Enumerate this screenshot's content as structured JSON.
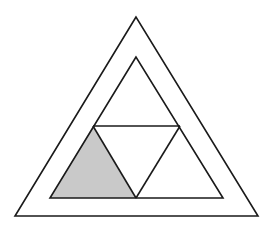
{
  "diagram": {
    "colors": {
      "stroke": "#1a1a1a",
      "shade": "#c9c9c9",
      "background": "#ffffff"
    },
    "outer_triangle": {
      "points": [
        [
          136,
          17
        ],
        [
          15,
          216
        ],
        [
          258,
          216
        ]
      ]
    },
    "inner_triangle": {
      "points": [
        [
          136,
          57
        ],
        [
          50,
          198
        ],
        [
          223,
          198
        ]
      ]
    },
    "midline": {
      "from": [
        93,
        126
      ],
      "to": [
        180,
        126
      ]
    },
    "inner_diagonals": [
      {
        "from": [
          93,
          126
        ],
        "to": [
          136,
          198
        ]
      },
      {
        "from": [
          180,
          126
        ],
        "to": [
          136,
          198
        ]
      }
    ],
    "shaded_triangle": {
      "points": [
        [
          93,
          126
        ],
        [
          50,
          198
        ],
        [
          136,
          198
        ]
      ]
    }
  }
}
